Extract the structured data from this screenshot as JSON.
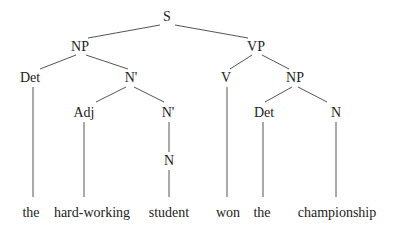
{
  "diagram": {
    "type": "syntax-tree",
    "nodes": [
      {
        "id": "S",
        "label": "S",
        "x": 167,
        "y": 21
      },
      {
        "id": "NP1",
        "label": "NP",
        "x": 80,
        "y": 51
      },
      {
        "id": "VP",
        "label": "VP",
        "x": 256,
        "y": 51
      },
      {
        "id": "Det1",
        "label": "Det",
        "x": 30,
        "y": 82
      },
      {
        "id": "Nbar1",
        "label": "N'",
        "x": 131,
        "y": 82
      },
      {
        "id": "V",
        "label": "V",
        "x": 226,
        "y": 82
      },
      {
        "id": "NP2",
        "label": "NP",
        "x": 295,
        "y": 82
      },
      {
        "id": "Adj",
        "label": "Adj",
        "x": 84,
        "y": 117
      },
      {
        "id": "Nbar2",
        "label": "N'",
        "x": 168,
        "y": 117
      },
      {
        "id": "Det2",
        "label": "Det",
        "x": 264,
        "y": 117
      },
      {
        "id": "N2",
        "label": "N",
        "x": 336,
        "y": 117
      },
      {
        "id": "N1",
        "label": "N",
        "x": 169,
        "y": 165
      }
    ],
    "edges": [
      {
        "from": "S",
        "to": "NP1",
        "x1": 160,
        "y1": 25,
        "x2": 88,
        "y2": 38
      },
      {
        "from": "S",
        "to": "VP",
        "x1": 175,
        "y1": 25,
        "x2": 248,
        "y2": 38
      },
      {
        "from": "NP1",
        "to": "Det1",
        "x1": 76,
        "y1": 55,
        "x2": 40,
        "y2": 69
      },
      {
        "from": "NP1",
        "to": "Nbar1",
        "x1": 86,
        "y1": 55,
        "x2": 128,
        "y2": 69
      },
      {
        "from": "Nbar1",
        "to": "Adj",
        "x1": 126,
        "y1": 87,
        "x2": 96,
        "y2": 102
      },
      {
        "from": "Nbar1",
        "to": "Nbar2",
        "x1": 134,
        "y1": 87,
        "x2": 164,
        "y2": 102
      },
      {
        "from": "Nbar2",
        "to": "N1",
        "x1": 169,
        "y1": 122,
        "x2": 169,
        "y2": 152
      },
      {
        "from": "VP",
        "to": "V",
        "x1": 252,
        "y1": 55,
        "x2": 230,
        "y2": 69
      },
      {
        "from": "VP",
        "to": "NP2",
        "x1": 262,
        "y1": 55,
        "x2": 289,
        "y2": 69
      },
      {
        "from": "NP2",
        "to": "Det2",
        "x1": 292,
        "y1": 87,
        "x2": 265,
        "y2": 102
      },
      {
        "from": "NP2",
        "to": "N2",
        "x1": 298,
        "y1": 87,
        "x2": 327,
        "y2": 102
      },
      {
        "from": "Det1",
        "to": "w-the1",
        "x1": 33,
        "y1": 87,
        "x2": 33,
        "y2": 197
      },
      {
        "from": "Adj",
        "to": "w-hardworking",
        "x1": 84,
        "y1": 122,
        "x2": 84,
        "y2": 197
      },
      {
        "from": "N1",
        "to": "w-student",
        "x1": 169,
        "y1": 170,
        "x2": 169,
        "y2": 197
      },
      {
        "from": "V",
        "to": "w-won",
        "x1": 227,
        "y1": 87,
        "x2": 227,
        "y2": 197
      },
      {
        "from": "Det2",
        "to": "w-the2",
        "x1": 263,
        "y1": 122,
        "x2": 263,
        "y2": 197
      },
      {
        "from": "N2",
        "to": "w-championship",
        "x1": 336,
        "y1": 122,
        "x2": 336,
        "y2": 197
      }
    ],
    "words": [
      {
        "id": "w-the1",
        "label": "the",
        "x": 31,
        "y": 217
      },
      {
        "id": "w-hardworking",
        "label": "hard-working",
        "x": 92,
        "y": 217
      },
      {
        "id": "w-student",
        "label": "student",
        "x": 169,
        "y": 217
      },
      {
        "id": "w-won",
        "label": "won",
        "x": 228,
        "y": 217
      },
      {
        "id": "w-the2",
        "label": "the",
        "x": 262,
        "y": 217
      },
      {
        "id": "w-championship",
        "label": "championship",
        "x": 337,
        "y": 217
      }
    ],
    "colors": {
      "text": "#222222",
      "line": "#555555",
      "background": "#ffffff"
    }
  }
}
